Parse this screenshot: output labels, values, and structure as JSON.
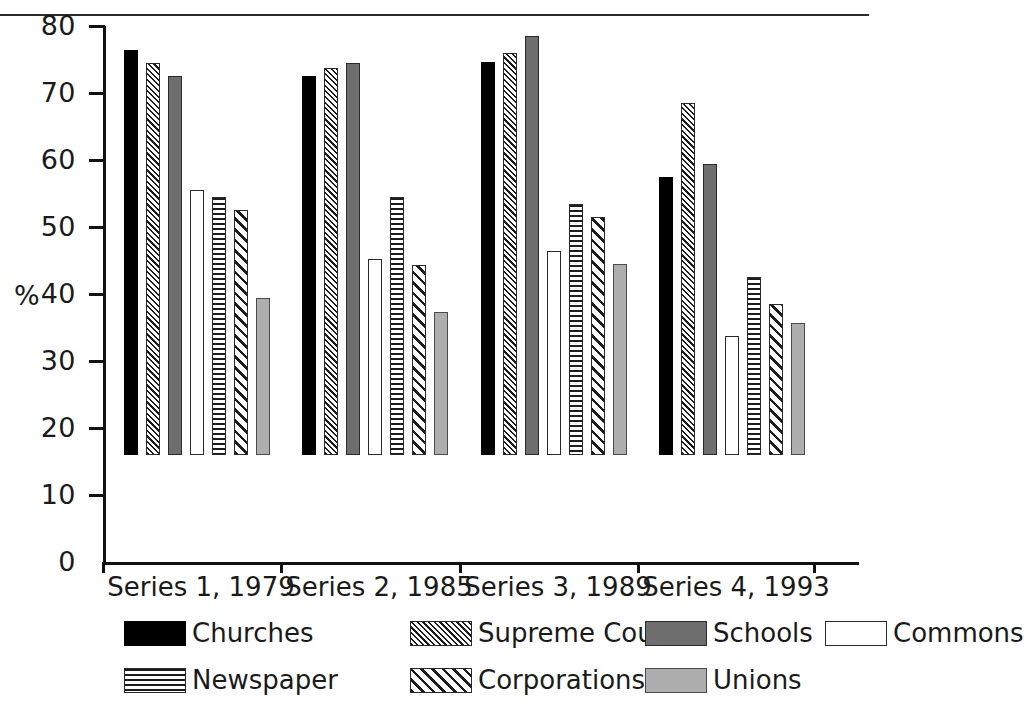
{
  "chart_data": {
    "type": "bar",
    "title": "",
    "xlabel": "",
    "ylabel": "%",
    "ylim": [
      0,
      80
    ],
    "ytick_step": 10,
    "yticks": [
      80,
      70,
      60,
      50,
      40,
      30,
      20,
      10,
      0
    ],
    "grid": false,
    "legend_position": "bottom",
    "categories": [
      "Series 1, 1979",
      "Series 2, 1985",
      "Series 3, 1989",
      "Series 4, 1993"
    ],
    "series": [
      {
        "name": "Churches",
        "pattern": "solid-black",
        "values": [
          60.5,
          56.5,
          58.7,
          41.5
        ]
      },
      {
        "name": "Supreme Court",
        "pattern": "fine-diagonal-hatch",
        "values": [
          58.5,
          57.8,
          60.0,
          52.5
        ]
      },
      {
        "name": "Schools",
        "pattern": "dark-gray-fill",
        "values": [
          56.5,
          58.5,
          62.5,
          43.5
        ]
      },
      {
        "name": "Commons",
        "pattern": "white-outline",
        "values": [
          39.5,
          29.3,
          30.4,
          17.8
        ]
      },
      {
        "name": "Newspaper",
        "pattern": "horizontal-lines",
        "values": [
          38.5,
          38.5,
          37.5,
          26.5
        ]
      },
      {
        "name": "Corporations",
        "pattern": "wide-diagonal-hatch",
        "values": [
          36.5,
          28.3,
          35.5,
          22.5
        ]
      },
      {
        "name": "Unions",
        "pattern": "light-gray-fill",
        "values": [
          23.5,
          21.3,
          28.5,
          19.7
        ]
      }
    ]
  },
  "axis": {
    "y_title": "%",
    "y_labels": [
      "80",
      "70",
      "60",
      "50",
      "40",
      "30",
      "20",
      "10",
      "0"
    ]
  },
  "x_labels": [
    "Series 1, 1979",
    "Series 2, 1985",
    "Series 3, 1989",
    "Series 4, 1993"
  ],
  "legend": {
    "row1": [
      "Churches",
      "Supreme Court",
      "Schools",
      "Commons"
    ],
    "row2": [
      "Newspaper",
      "Corporations",
      "Unions"
    ]
  },
  "colors": {
    "ink": "#111111",
    "solid": "#000000",
    "dark_gray": "#6e6e6e",
    "light_gray": "#aeaeae",
    "white": "#ffffff"
  }
}
